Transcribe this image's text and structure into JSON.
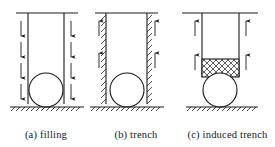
{
  "figure": {
    "background_color": "#ffffff",
    "line_color": "#1a1a1a",
    "panel_count": 3
  },
  "panels": [
    {
      "id": "a",
      "caption": "(a)  filling",
      "label": "(a)",
      "name": "filling",
      "arrow_direction": "down",
      "arrow_count_per_side": 4,
      "wall_style": "plain",
      "has_mesh_block": false,
      "ground_hatched": true,
      "pipe_shape": "circle"
    },
    {
      "id": "b",
      "caption": "(b)  trench",
      "label": "(b)",
      "name": "trench",
      "arrow_direction": "up",
      "arrow_count_per_side": 2,
      "wall_style": "hatched",
      "has_mesh_block": false,
      "ground_hatched": true,
      "pipe_shape": "circle"
    },
    {
      "id": "c",
      "caption": "(c)  induced trench",
      "label": "(c)",
      "name": "induced trench",
      "arrow_direction": "up",
      "arrow_count_per_side": 2,
      "wall_style": "plain",
      "has_mesh_block": true,
      "mesh_pattern": "cross-hatch",
      "ground_hatched": true,
      "pipe_shape": "circle"
    }
  ]
}
